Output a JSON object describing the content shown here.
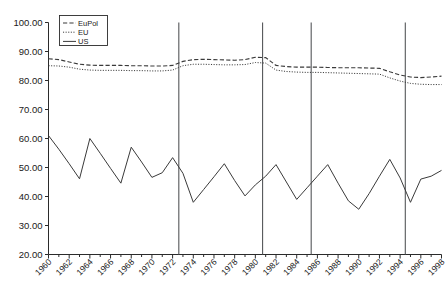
{
  "chart_data": {
    "type": "line",
    "title": "",
    "xlabel": "",
    "ylabel": "",
    "xlim": [
      1960,
      1998
    ],
    "ylim": [
      20,
      100
    ],
    "grid": false,
    "legend_position": "top-left",
    "y_ticks": [
      "20.00",
      "30.00",
      "40.00",
      "50.00",
      "60.00",
      "70.00",
      "80.00",
      "90.00",
      "100.00"
    ],
    "y_tick_values": [
      20,
      30,
      40,
      50,
      60,
      70,
      80,
      90,
      100
    ],
    "x_ticks": [
      "1960",
      "1962",
      "1964",
      "1966",
      "1968",
      "1970",
      "1972",
      "1974",
      "1976",
      "1978",
      "1980",
      "1982",
      "1984",
      "1986",
      "1988",
      "1990",
      "1992",
      "1994",
      "1996",
      "1998"
    ],
    "x_tick_values": [
      1960,
      1962,
      1964,
      1966,
      1968,
      1970,
      1972,
      1974,
      1976,
      1978,
      1980,
      1982,
      1984,
      1986,
      1988,
      1990,
      1992,
      1994,
      1996,
      1998
    ],
    "x": [
      1960,
      1961,
      1962,
      1963,
      1964,
      1965,
      1966,
      1967,
      1968,
      1969,
      1970,
      1971,
      1972,
      1973,
      1974,
      1975,
      1976,
      1977,
      1978,
      1979,
      1980,
      1981,
      1982,
      1983,
      1984,
      1985,
      1986,
      1987,
      1988,
      1989,
      1990,
      1991,
      1992,
      1993,
      1994,
      1995,
      1996,
      1997,
      1998
    ],
    "series": [
      {
        "name": "EuPol",
        "style": "dashed",
        "color": "#3a3a3a",
        "values": [
          87.5,
          87.2,
          86.4,
          85.6,
          85.3,
          85.2,
          85.2,
          85.2,
          85.1,
          85.1,
          85.0,
          85.0,
          85.2,
          86.6,
          87.2,
          87.3,
          87.2,
          87.1,
          87.0,
          87.2,
          88.0,
          87.9,
          85.2,
          84.8,
          84.6,
          84.6,
          84.6,
          84.5,
          84.4,
          84.4,
          84.4,
          84.3,
          84.2,
          83.0,
          81.9,
          81.2,
          81.0,
          81.2,
          81.5
        ]
      },
      {
        "name": "EU",
        "style": "dotted",
        "color": "#3a3a3a",
        "values": [
          85.1,
          85.0,
          84.6,
          83.9,
          83.6,
          83.5,
          83.5,
          83.5,
          83.4,
          83.4,
          83.3,
          83.3,
          83.6,
          85.1,
          85.6,
          85.6,
          85.5,
          85.4,
          85.4,
          85.5,
          86.2,
          86.0,
          83.6,
          83.1,
          82.9,
          82.8,
          82.8,
          82.7,
          82.6,
          82.5,
          82.4,
          82.3,
          82.2,
          80.9,
          79.8,
          79.0,
          78.7,
          78.6,
          78.6
        ]
      },
      {
        "name": "US",
        "style": "solid",
        "color": "#3a3a3a",
        "values": [
          61.0,
          56.3,
          51.3,
          46.1,
          60.0,
          54.9,
          49.7,
          44.6,
          57.0,
          51.9,
          46.6,
          48.2,
          53.4,
          48.0,
          38.0,
          42.4,
          46.8,
          51.3,
          45.5,
          40.2,
          44.0,
          47.0,
          51.0,
          45.0,
          39.0,
          43.0,
          47.0,
          51.0,
          44.6,
          38.5,
          35.6,
          41.0,
          47.0,
          52.8,
          46.4,
          38.0,
          46.0,
          47.0,
          49.0
        ]
      }
    ],
    "separator_lines": [
      1972.6,
      1980.7,
      1985.4,
      1994.5
    ]
  },
  "legend": {
    "items": [
      {
        "label": "EuPol"
      },
      {
        "label": "EU"
      },
      {
        "label": "US"
      }
    ]
  }
}
